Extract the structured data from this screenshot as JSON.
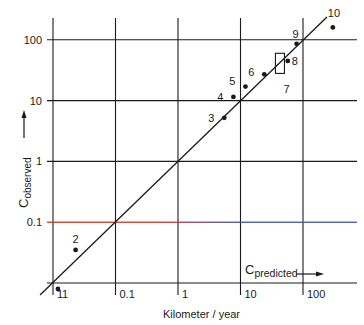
{
  "chart_data": {
    "type": "scatter",
    "title": "",
    "xlabel": "Kilometer / year",
    "ylabel": "C observed",
    "x_axis_label_main": "C",
    "x_axis_label_sub": "predicted",
    "y_axis_label_main": "C",
    "y_axis_label_sub": "observed",
    "x_scale": "log",
    "y_scale": "log",
    "xlim": [
      0.01,
      400
    ],
    "ylim": [
      0.01,
      400
    ],
    "x_ticks": [
      {
        "value": 0.01,
        "label": "1"
      },
      {
        "value": 0.1,
        "label": "0.1"
      },
      {
        "value": 1,
        "label": "1"
      },
      {
        "value": 10,
        "label": "10"
      },
      {
        "value": 100,
        "label": "100"
      }
    ],
    "y_ticks": [
      {
        "value": 0.1,
        "label": "0.1"
      },
      {
        "value": 1,
        "label": "1"
      },
      {
        "value": 10,
        "label": "10"
      },
      {
        "value": 100,
        "label": "100"
      }
    ],
    "grid": true,
    "reference_line": {
      "type": "y=x",
      "label": "1:1 line"
    },
    "highlight_line": {
      "y": 0.1,
      "colors": [
        "#c0392b",
        "#3a56a8"
      ]
    },
    "points": [
      {
        "id": "1",
        "x": 0.012,
        "y": 0.008
      },
      {
        "id": "2",
        "x": 0.023,
        "y": 0.035
      },
      {
        "id": "3",
        "x": 5.5,
        "y": 5.2
      },
      {
        "id": "4",
        "x": 7.7,
        "y": 11.5
      },
      {
        "id": "5",
        "x": 12,
        "y": 17
      },
      {
        "id": "6",
        "x": 24,
        "y": 27
      },
      {
        "id": "7",
        "x": 42,
        "y": [
          28,
          60
        ],
        "shape": "range-box"
      },
      {
        "id": "8",
        "x": 57,
        "y": 45
      },
      {
        "id": "9",
        "x": 79,
        "y": 86
      },
      {
        "id": "10",
        "x": 300,
        "y": 160
      }
    ]
  }
}
